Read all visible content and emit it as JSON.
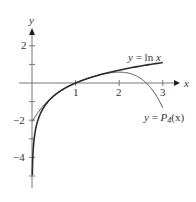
{
  "chart_data": {
    "type": "line",
    "title": "",
    "xlabel": "x",
    "ylabel": "y",
    "xlim": [
      0,
      3.3
    ],
    "ylim": [
      -5.5,
      2.9
    ],
    "x_ticks": [
      1,
      2,
      3
    ],
    "x_tick_labels": [
      "1",
      "2",
      "3"
    ],
    "y_ticks": [
      -5,
      -4,
      -3,
      -2,
      -1,
      1,
      2
    ],
    "y_tick_labels": {
      "2": "2",
      "-2": "−2",
      "-4": "−4"
    },
    "grid": false,
    "series": [
      {
        "name": "y = ln x",
        "function": "ln(x)",
        "domain": [
          0.007,
          3.0
        ],
        "color": "#333333",
        "width": 1.6,
        "sample_points": [
          [
            0.01,
            -4.61
          ],
          [
            0.25,
            -1.39
          ],
          [
            0.5,
            -0.69
          ],
          [
            1,
            0
          ],
          [
            1.5,
            0.41
          ],
          [
            2,
            0.69
          ],
          [
            2.5,
            0.92
          ],
          [
            3,
            1.1
          ]
        ]
      },
      {
        "name": "y = P4(x)",
        "function": "(x-1)-(x-1)^2/2+(x-1)^3/3-(x-1)^4/4",
        "domain": [
          0,
          3.0
        ],
        "color": "#555555",
        "width": 1.0,
        "sample_points": [
          [
            0,
            -2.08
          ],
          [
            0.5,
            -0.68
          ],
          [
            1,
            0
          ],
          [
            1.5,
            0.4
          ],
          [
            2,
            0.58
          ],
          [
            2.5,
            0.28
          ],
          [
            3,
            -1.33
          ]
        ]
      }
    ],
    "annotations": [
      {
        "text": "y = ln x",
        "x": 2.3,
        "y": 1.35
      },
      {
        "text": "y = P4(x)",
        "x": 2.5,
        "y": -1.7
      }
    ]
  },
  "labels": {
    "x_axis": "x",
    "y_axis": "y",
    "ln_label": "y = ln x",
    "p4_label_prefix": "y = ",
    "p4_label_p": "P",
    "p4_label_sub": "4",
    "p4_label_arg": "(x)",
    "xt1": "1",
    "xt2": "2",
    "xt3": "3",
    "yt2": "2",
    "ytm2": "−2",
    "ytm4": "−4"
  }
}
